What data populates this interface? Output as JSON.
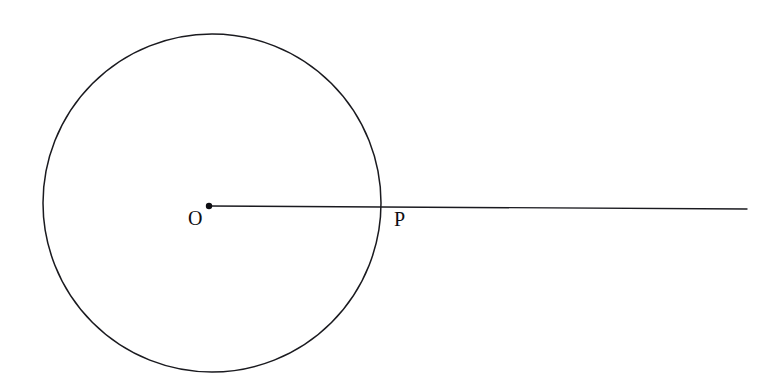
{
  "figure": {
    "kind": "geometry-diagram",
    "background_color": "#ffffff",
    "stroke_color": "#1a1a1f",
    "canvas": {
      "width": 780,
      "height": 388
    },
    "circle": {
      "label": "circle",
      "center_x": 212,
      "center_y": 203,
      "radius": 169,
      "stroke_width": 1.5,
      "fill": "none"
    },
    "center_point": {
      "label": "O",
      "x": 209,
      "y": 206,
      "marker": "filled-dot",
      "marker_radius": 3.2
    },
    "intersection_point": {
      "label": "P",
      "x": 381,
      "y": 207,
      "marker": "none"
    },
    "ray": {
      "label": "ray-OP",
      "x1": 209,
      "y1": 206,
      "x2": 747,
      "y2": 209,
      "stroke_width": 1.4
    },
    "labels": [
      {
        "id": "O",
        "text": "O",
        "x": 196,
        "y": 219
      },
      {
        "id": "P",
        "text": "P",
        "x": 402,
        "y": 220
      }
    ]
  },
  "chart_data": {
    "type": "diagram",
    "title": "",
    "shapes": [
      {
        "type": "circle",
        "name": "circle-centered-at-O",
        "cx": 212,
        "cy": 203,
        "r": 169,
        "filled": false
      },
      {
        "type": "point",
        "name": "O",
        "x": 209,
        "y": 206,
        "filled": true
      },
      {
        "type": "point",
        "name": "P",
        "x": 381,
        "y": 207,
        "filled": false
      },
      {
        "type": "ray",
        "name": "ray-from-O-through-P",
        "from": [
          209,
          206
        ],
        "to": [
          747,
          209
        ]
      }
    ],
    "annotations": [
      "O",
      "P"
    ]
  }
}
